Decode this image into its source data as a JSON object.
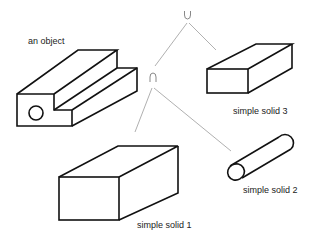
{
  "diagram": {
    "type": "CSG tree",
    "operators": {
      "root": {
        "symbol": "∪",
        "name": "union"
      },
      "child": {
        "symbol": "∩",
        "name": "intersection"
      }
    },
    "labels": {
      "object": "an object",
      "solid1": "simple solid 1",
      "solid2": "simple solid 2",
      "solid3": "simple solid 3"
    },
    "colors": {
      "outline": "#111111",
      "tree_edges": "#b0b0b0",
      "background": "#ffffff"
    }
  }
}
